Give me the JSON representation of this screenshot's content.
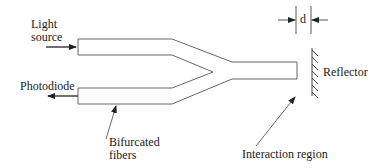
{
  "diagram": {
    "type": "fiber-optic-reflective-sensor",
    "labels": {
      "light_source_line1": "Light",
      "light_source_line2": "source",
      "photodiode": "Photodiode",
      "bifurcated_line1": "Bifurcated",
      "bifurcated_line2": "fibers",
      "interaction_region": "Interaction region",
      "reflector": "Reflector",
      "distance": "d"
    },
    "colors": {
      "line": "#555555",
      "text": "#1a1a1a",
      "background": "#ffffff"
    }
  }
}
